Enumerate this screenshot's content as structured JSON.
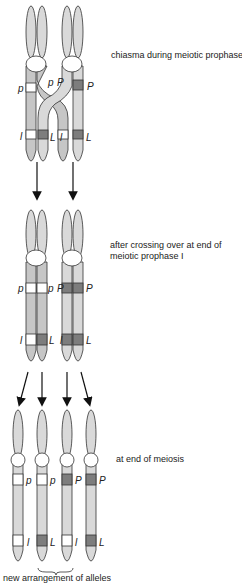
{
  "colors": {
    "chromatid_light": "#d9d9d9",
    "chromatid_mid": "#c6c6c6",
    "allele_dark": "#7d7d7d",
    "allele_light": "#ffffff",
    "outline": "#333333",
    "arrow": "#111111",
    "text": "#222222"
  },
  "stages": [
    {
      "caption": "chiasma during meiotic prophase I",
      "labels": [
        "p",
        "p",
        "P",
        "P",
        "l",
        "L",
        "l",
        "L"
      ]
    },
    {
      "caption_line1": "after crossing over at end of",
      "caption_line2": "meiotic prophase I",
      "labels": [
        "p",
        "p",
        "P",
        "P",
        "l",
        "L",
        "l",
        "L"
      ]
    },
    {
      "caption": "at end of meiosis",
      "labels": [
        "p",
        "p",
        "P",
        "P",
        "l",
        "L",
        "l",
        "L"
      ]
    }
  ],
  "bracket_label": "new arrangement of alleles"
}
